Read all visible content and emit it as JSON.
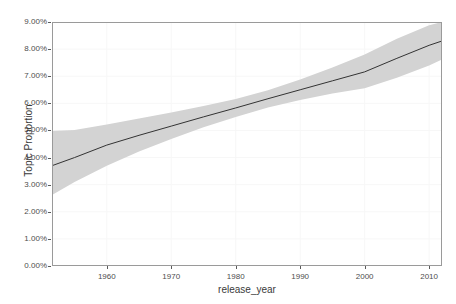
{
  "chart_data": {
    "type": "line",
    "title": "",
    "xlabel": "release_year",
    "ylabel": "Topic Proportion",
    "xlim": [
      1951.5,
      2012.0
    ],
    "ylim": [
      0.0,
      9.0
    ],
    "grid": true,
    "legend": null,
    "y_tick_labels": [
      "0.00%",
      "1.00%",
      "2.00%",
      "3.00%",
      "4.00%",
      "5.00%",
      "6.00%",
      "7.00%",
      "8.00%",
      "9.00%"
    ],
    "y_tick_values": [
      0,
      1,
      2,
      3,
      4,
      5,
      6,
      7,
      8,
      9
    ],
    "x_tick_labels": [
      "1960",
      "1970",
      "1980",
      "1990",
      "2000",
      "2010"
    ],
    "x_tick_values": [
      1960,
      1970,
      1980,
      1990,
      2000,
      2010
    ],
    "series": [
      {
        "name": "Topic Proportion (estimate)",
        "kind": "line",
        "color": "#333333",
        "x": [
          1951.5,
          1955,
          1960,
          1965,
          1970,
          1975,
          1980,
          1985,
          1990,
          1995,
          2000,
          2005,
          2010,
          2012
        ],
        "values": [
          3.7,
          4.0,
          4.46,
          4.82,
          5.16,
          5.5,
          5.83,
          6.17,
          6.5,
          6.83,
          7.16,
          7.66,
          8.14,
          8.3
        ]
      },
      {
        "name": "95% credible interval",
        "kind": "ribbon",
        "color": "#d3d3d3",
        "x": [
          1951.5,
          1955,
          1960,
          1965,
          1970,
          1975,
          1980,
          1985,
          1990,
          1995,
          2000,
          2005,
          2010,
          2012
        ],
        "lower": [
          2.62,
          3.1,
          3.7,
          4.22,
          4.68,
          5.12,
          5.5,
          5.85,
          6.12,
          6.36,
          6.56,
          6.94,
          7.4,
          7.62
        ],
        "upper": [
          4.98,
          5.02,
          5.22,
          5.44,
          5.66,
          5.9,
          6.16,
          6.48,
          6.88,
          7.32,
          7.8,
          8.38,
          8.88,
          9.0
        ]
      }
    ]
  },
  "axes": {
    "y_title": "Topic Proportion",
    "x_title": "release_year"
  }
}
